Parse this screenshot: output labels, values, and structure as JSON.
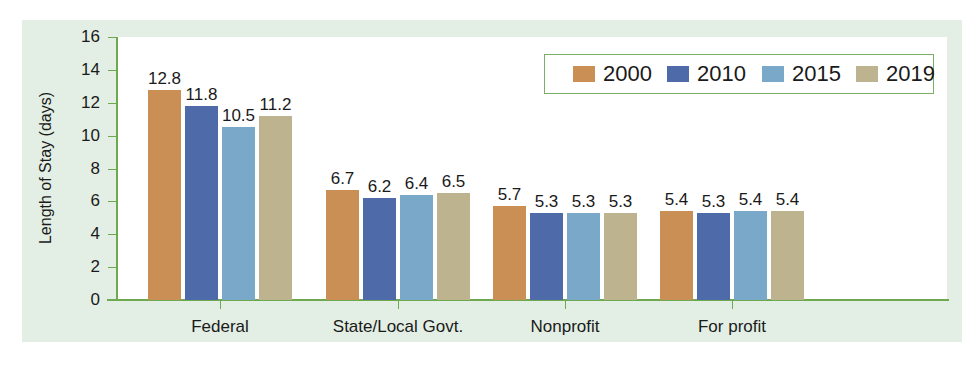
{
  "chart_data": {
    "type": "bar",
    "title": "",
    "xlabel": "",
    "ylabel": "Length of Stay (days)",
    "ylim": [
      0,
      16
    ],
    "yticks": [
      0,
      2,
      4,
      6,
      8,
      10,
      12,
      14,
      16
    ],
    "grid": false,
    "legend_position": "top-right",
    "categories": [
      "Federal",
      "State/Local Govt.",
      "Nonprofit",
      "For profit"
    ],
    "series": [
      {
        "name": "2000",
        "color": "#c98f55",
        "values": [
          12.8,
          6.7,
          5.7,
          5.4
        ]
      },
      {
        "name": "2010",
        "color": "#4f6aa9",
        "values": [
          11.8,
          6.2,
          5.3,
          5.3
        ]
      },
      {
        "name": "2015",
        "color": "#79a8c8",
        "values": [
          10.5,
          6.4,
          5.3,
          5.4
        ]
      },
      {
        "name": "2019",
        "color": "#bdb48f",
        "values": [
          11.2,
          6.5,
          5.3,
          5.4
        ]
      }
    ],
    "data_labels": [
      [
        "12.8",
        "6.7",
        "5.7",
        "5.4"
      ],
      [
        "11.8",
        "6.2",
        "5.3",
        "5.3"
      ],
      [
        "10.5",
        "6.4",
        "5.3",
        "5.4"
      ],
      [
        "11.2",
        "6.5",
        "5.3",
        "5.4"
      ]
    ]
  },
  "axis": {
    "y_title": "Length of Stay (days)",
    "y_tick_labels": [
      "0",
      "2",
      "4",
      "6",
      "8",
      "10",
      "12",
      "14",
      "16"
    ],
    "x_tick_labels": [
      "Federal",
      "State/Local Govt.",
      "Nonprofit",
      "For profit"
    ]
  },
  "legend": {
    "items": [
      {
        "label": "2000",
        "color": "#c98f55"
      },
      {
        "label": "2010",
        "color": "#4f6aa9"
      },
      {
        "label": "2015",
        "color": "#79a8c8"
      },
      {
        "label": "2019",
        "color": "#bdb48f"
      }
    ]
  },
  "colors": {
    "panel_background": "#e3efe4",
    "axis_green": "#6fa94f",
    "plot_background": "#ffffff"
  }
}
